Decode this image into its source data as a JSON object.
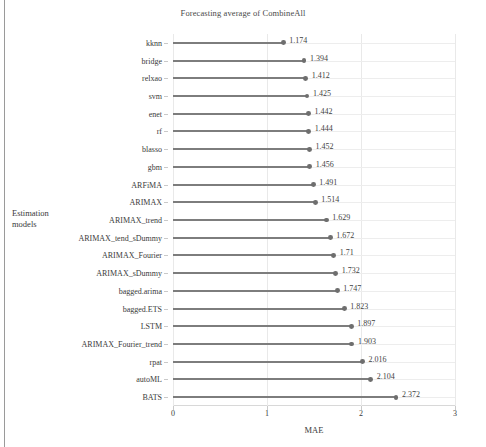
{
  "chart_data": {
    "type": "bar",
    "subtype": "horizontal-lollipop",
    "title": "Forecasting average of CombineAll",
    "xlabel": "MAE",
    "ylabel": "Estimation models",
    "ylabel_lines": [
      "Estimation",
      "models"
    ],
    "xlim": [
      0,
      3
    ],
    "xticks": [
      0,
      1,
      2,
      3
    ],
    "xtick_labels": [
      "0",
      "1",
      "2",
      "3"
    ],
    "grid": true,
    "legend": null,
    "orientation": "horizontal",
    "categories": [
      "kknn",
      "bridge",
      "relxao",
      "svm",
      "enet",
      "rf",
      "blasso",
      "gbm",
      "ARFiMA",
      "ARIMAX",
      "ARIMAX_trend",
      "ARIMAX_tend_sDummy",
      "ARIMAX_Fourier",
      "ARIMAX_sDummy",
      "bagged.arima",
      "bagged.ETS",
      "LSTM",
      "ARIMAX_Fourier_trend",
      "rpat",
      "autoML",
      "BATS"
    ],
    "values": [
      1.174,
      1.394,
      1.412,
      1.425,
      1.442,
      1.444,
      1.452,
      1.456,
      1.491,
      1.514,
      1.629,
      1.672,
      1.71,
      1.732,
      1.747,
      1.823,
      1.897,
      1.903,
      2.016,
      2.104,
      2.372
    ],
    "value_labels": [
      "1.174",
      "1.394",
      "1.412",
      "1.425",
      "1.442",
      "1.444",
      "1.452",
      "1.456",
      "1.491",
      "1.514",
      "1.629",
      "1.672",
      "1.71",
      "1.732",
      "1.747",
      "1.823",
      "1.897",
      "1.903",
      "2.016",
      "2.104",
      "2.372"
    ],
    "colors": {
      "line": "#7d7d7d",
      "marker": "#6e6e6e",
      "grid": "#e9e9e9",
      "text": "#3a3a3a",
      "background": "#ffffff"
    }
  }
}
